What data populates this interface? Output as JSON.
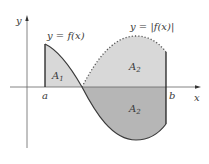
{
  "figure": {
    "title": "",
    "labels": {
      "y_axis": "y",
      "x_axis": "x",
      "a": "a",
      "b": "b",
      "curve_f": "y = f(x)",
      "curve_abs": "y = |f(x)|",
      "region1": "A",
      "region1_sub": "1",
      "region2_upper": "A",
      "region2_upper_sub": "2",
      "region2_lower": "A",
      "region2_lower_sub": "2"
    },
    "colors": {
      "axis": "#555555",
      "curve": "#3a3a3a",
      "shade_light": "#d6d6d6",
      "shade_dark": "#b4b4b4",
      "dotted": "#555555"
    }
  }
}
